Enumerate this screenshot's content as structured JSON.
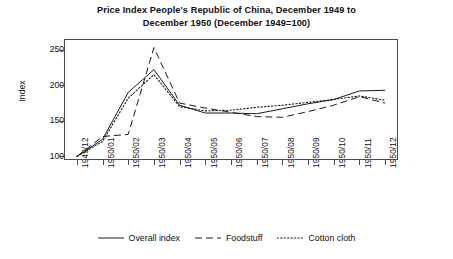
{
  "chart_data": {
    "type": "line",
    "title": "Price Index People's Republic of China, December 1949 to December 1950 (December 1949=100)",
    "title_line1": "Price Index People's Republic of China, December 1949 to",
    "title_line2": "December 1950 (December 1949=100)",
    "xlabel": "",
    "ylabel": "Index",
    "ylim": [
      95,
      265
    ],
    "yticks": [
      100,
      150,
      200,
      250
    ],
    "ytick_labels": [
      "100",
      "150",
      "200",
      "250"
    ],
    "grid": false,
    "legend_position": "bottom",
    "categories": [
      "1949/12",
      "1950/01",
      "1950/02",
      "1950/03",
      "1950/04",
      "1950/05",
      "1950/06",
      "1950/07",
      "1950/08",
      "1950/09",
      "1950/10",
      "1950/11",
      "1950/12"
    ],
    "series": [
      {
        "name": "Overall index",
        "style": "solid",
        "values": [
          100,
          124,
          190,
          222,
          172,
          161,
          161,
          160,
          167,
          174,
          180,
          192,
          193
        ]
      },
      {
        "name": "Foodstuff",
        "style": "dashed",
        "values": [
          100,
          128,
          131,
          253,
          175,
          168,
          162,
          156,
          155,
          163,
          172,
          184,
          175
        ]
      },
      {
        "name": "Cotton cloth",
        "style": "dotted",
        "values": [
          100,
          121,
          182,
          215,
          170,
          164,
          165,
          169,
          172,
          176,
          180,
          185,
          179
        ]
      }
    ]
  },
  "axes": {
    "y_label": "Index"
  },
  "legend": {
    "entries": [
      {
        "label": "Overall index",
        "icon": "solid-line-icon"
      },
      {
        "label": "Foodstuff",
        "icon": "dashed-line-icon"
      },
      {
        "label": "Cotton cloth",
        "icon": "dotted-line-icon"
      }
    ]
  },
  "colors": {
    "line": "#1a1a1a",
    "axis": "#4a4a4a",
    "text": "#111111",
    "background": "#ffffff"
  }
}
